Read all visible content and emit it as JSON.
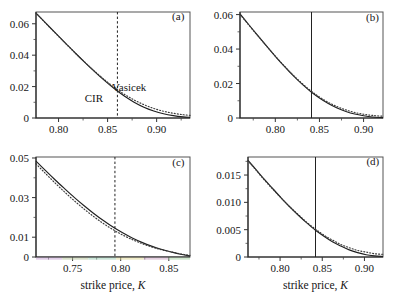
{
  "figure": {
    "caption_axis_label": "strike price, K",
    "axis_label_prefix": "strike price, ",
    "axis_label_symbol": "K",
    "curve_labels": {
      "solid": "CIR",
      "dotted": "Vasicek"
    },
    "colors": {
      "curve_solid": "#1f1f1f",
      "curve_dotted": "#3a3a3a",
      "axis": "#222222",
      "frame": "#555555",
      "background": "#ffffff"
    }
  },
  "chart_data": [
    {
      "type": "line",
      "panel": "(a)",
      "title": "",
      "xlabel": "",
      "ylabel": "",
      "xlim": [
        0.777,
        0.934
      ],
      "ylim": [
        0.0,
        0.0675
      ],
      "xticks": [
        0.8,
        0.85,
        0.9
      ],
      "xticklabels": [
        "0.80",
        "0.85",
        "0.90"
      ],
      "xminorticks": [
        0.775,
        0.825,
        0.875,
        0.925
      ],
      "yticks": [
        0,
        0.02,
        0.04,
        0.06
      ],
      "yticklabels": [
        "0",
        "0.02",
        "0.04",
        "0.06"
      ],
      "yminorticks": [
        0.01,
        0.03,
        0.05
      ],
      "grid": false,
      "vline": {
        "x": 0.86,
        "style": "dashed"
      },
      "annotations": [
        {
          "text": "CIR",
          "x": 0.836,
          "y": 0.0105
        },
        {
          "text": "Vasicek",
          "x": 0.872,
          "y": 0.0175
        },
        {
          "text": "(a)",
          "x": 0.922,
          "y": 0.0625
        }
      ],
      "series": [
        {
          "name": "CIR",
          "style": "solid",
          "x": [
            0.777,
            0.787,
            0.797,
            0.807,
            0.817,
            0.827,
            0.837,
            0.847,
            0.857,
            0.867,
            0.877,
            0.887,
            0.897,
            0.907,
            0.917,
            0.927,
            0.934
          ],
          "y": [
            0.0668,
            0.0604,
            0.054,
            0.0477,
            0.0414,
            0.0353,
            0.0294,
            0.0238,
            0.0186,
            0.014,
            0.0101,
            0.0069,
            0.0045,
            0.0027,
            0.0015,
            0.0007,
            0.0004
          ]
        },
        {
          "name": "Vasicek",
          "style": "dotted",
          "x": [
            0.777,
            0.787,
            0.797,
            0.807,
            0.817,
            0.827,
            0.837,
            0.847,
            0.857,
            0.867,
            0.877,
            0.887,
            0.897,
            0.907,
            0.917,
            0.927,
            0.934
          ],
          "y": [
            0.0668,
            0.0603,
            0.0539,
            0.0476,
            0.0414,
            0.0354,
            0.0297,
            0.0243,
            0.0194,
            0.0151,
            0.0115,
            0.0085,
            0.0061,
            0.0043,
            0.003,
            0.0021,
            0.0017
          ]
        }
      ]
    },
    {
      "type": "line",
      "panel": "(b)",
      "title": "",
      "xlabel": "",
      "ylabel": "",
      "xlim": [
        0.76,
        0.922
      ],
      "ylim": [
        0.0,
        0.0615
      ],
      "xticks": [
        0.8,
        0.85,
        0.9
      ],
      "xticklabels": [
        "0.80",
        "0.85",
        "0.90"
      ],
      "xminorticks": [
        0.775,
        0.825,
        0.875
      ],
      "yticks": [
        0,
        0.02,
        0.04,
        0.06
      ],
      "yticklabels": [
        "0",
        "0.02",
        "0.04",
        "0.06"
      ],
      "yminorticks": [
        0.01,
        0.03,
        0.05
      ],
      "grid": false,
      "vline": {
        "x": 0.841,
        "style": "solid"
      },
      "annotations": [
        {
          "text": "(b)",
          "x": 0.91,
          "y": 0.0565
        }
      ],
      "series": [
        {
          "name": "CIR",
          "style": "solid",
          "x": [
            0.76,
            0.77,
            0.78,
            0.79,
            0.8,
            0.81,
            0.82,
            0.83,
            0.84,
            0.85,
            0.86,
            0.87,
            0.88,
            0.89,
            0.9,
            0.91,
            0.922
          ],
          "y": [
            0.0604,
            0.0541,
            0.0479,
            0.0418,
            0.0358,
            0.0301,
            0.0247,
            0.0198,
            0.0154,
            0.0116,
            0.0084,
            0.0058,
            0.0038,
            0.0023,
            0.0013,
            0.0006,
            0.0002
          ]
        },
        {
          "name": "Vasicek",
          "style": "dotted",
          "x": [
            0.76,
            0.77,
            0.78,
            0.79,
            0.8,
            0.81,
            0.82,
            0.83,
            0.84,
            0.85,
            0.86,
            0.87,
            0.88,
            0.89,
            0.9,
            0.91,
            0.922
          ],
          "y": [
            0.0601,
            0.0539,
            0.0478,
            0.0418,
            0.0359,
            0.0303,
            0.025,
            0.0202,
            0.0159,
            0.0122,
            0.0091,
            0.0066,
            0.0047,
            0.0032,
            0.0022,
            0.0015,
            0.001
          ]
        }
      ]
    },
    {
      "type": "line",
      "panel": "(c)",
      "title": "",
      "xlabel": "strike price, K",
      "ylabel": "",
      "xlim": [
        0.712,
        0.872
      ],
      "ylim": [
        0.0,
        0.0505
      ],
      "xticks": [
        0.75,
        0.8,
        0.85
      ],
      "xticklabels": [
        "0.75",
        "0.80",
        "0.85"
      ],
      "xminorticks": [
        0.725,
        0.775,
        0.825
      ],
      "yticks": [
        0,
        0.01,
        0.03,
        0.05
      ],
      "yticklabels": [
        "0",
        "0.01",
        "0.03",
        "0.05"
      ],
      "yminorticks": [
        0.02,
        0.04
      ],
      "grid": false,
      "vline": {
        "x": 0.794,
        "style": "dashed"
      },
      "annotations": [
        {
          "text": "(c)",
          "x": 0.86,
          "y": 0.046
        }
      ],
      "series": [
        {
          "name": "CIR",
          "style": "solid",
          "x": [
            0.712,
            0.722,
            0.732,
            0.742,
            0.752,
            0.762,
            0.772,
            0.782,
            0.792,
            0.802,
            0.812,
            0.822,
            0.832,
            0.842,
            0.852,
            0.862,
            0.872
          ],
          "y": [
            0.0484,
            0.0436,
            0.0389,
            0.0344,
            0.03,
            0.0259,
            0.022,
            0.0184,
            0.0151,
            0.0122,
            0.0096,
            0.0074,
            0.0055,
            0.0039,
            0.0026,
            0.0014,
            0.0005
          ]
        },
        {
          "name": "Vasicek",
          "style": "dotted",
          "x": [
            0.712,
            0.722,
            0.732,
            0.742,
            0.752,
            0.762,
            0.772,
            0.782,
            0.792,
            0.802,
            0.812,
            0.822,
            0.832,
            0.842,
            0.852,
            0.862,
            0.872
          ],
          "y": [
            0.0471,
            0.0421,
            0.0373,
            0.0327,
            0.0283,
            0.0242,
            0.0204,
            0.0169,
            0.0138,
            0.0111,
            0.0088,
            0.0068,
            0.0051,
            0.0037,
            0.0026,
            0.0016,
            0.0008
          ]
        }
      ]
    },
    {
      "type": "line",
      "panel": "(d)",
      "title": "",
      "xlabel": "strike price, K",
      "ylabel": "",
      "xlim": [
        0.762,
        0.922
      ],
      "ylim": [
        0.0,
        0.0183
      ],
      "xticks": [
        0.8,
        0.85,
        0.9
      ],
      "xticklabels": [
        "0.80",
        "0.85",
        "0.90"
      ],
      "xminorticks": [
        0.775,
        0.825,
        0.875
      ],
      "yticks": [
        0,
        0.005,
        0.01,
        0.015
      ],
      "yticklabels": [
        "0",
        "0.005",
        "0.010",
        "0.015"
      ],
      "yminorticks": [
        0.0025,
        0.0075,
        0.0125,
        0.0175
      ],
      "grid": false,
      "vline": {
        "x": 0.842,
        "style": "solid"
      },
      "annotations": [
        {
          "text": "(d)",
          "x": 0.91,
          "y": 0.0168
        }
      ],
      "series": [
        {
          "name": "CIR",
          "style": "solid",
          "x": [
            0.762,
            0.772,
            0.782,
            0.792,
            0.802,
            0.812,
            0.822,
            0.832,
            0.842,
            0.852,
            0.862,
            0.872,
            0.882,
            0.892,
            0.902,
            0.912,
            0.922
          ],
          "y": [
            0.0177,
            0.0159,
            0.0141,
            0.0124,
            0.0107,
            0.0091,
            0.0076,
            0.0062,
            0.0049,
            0.0038,
            0.0028,
            0.002,
            0.0013,
            0.0008,
            0.0004,
            0.0002,
            0.0001
          ]
        },
        {
          "name": "Vasicek",
          "style": "dotted",
          "x": [
            0.762,
            0.772,
            0.782,
            0.792,
            0.802,
            0.812,
            0.822,
            0.832,
            0.842,
            0.852,
            0.862,
            0.872,
            0.882,
            0.892,
            0.902,
            0.912,
            0.922
          ],
          "y": [
            0.0176,
            0.0158,
            0.014,
            0.0123,
            0.0107,
            0.0091,
            0.0077,
            0.0063,
            0.0051,
            0.004,
            0.0031,
            0.0023,
            0.0017,
            0.0012,
            0.0009,
            0.0006,
            0.0005
          ]
        }
      ]
    }
  ]
}
